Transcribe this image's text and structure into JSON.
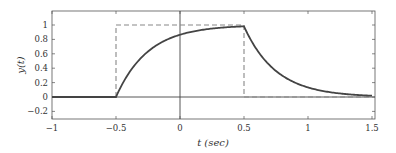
{
  "chart_data": {
    "type": "line",
    "title": "",
    "xlabel": "t (sec)",
    "ylabel": "y(t)",
    "xlim": [
      -1,
      1.5
    ],
    "ylim": [
      -0.3,
      1.2
    ],
    "xticks": [
      -1,
      -0.5,
      0,
      0.5,
      1,
      1.5
    ],
    "xtick_labels": [
      "−1",
      "−0.5",
      "0",
      "0.5",
      "1",
      "1.5"
    ],
    "yticks": [
      -0.2,
      0,
      0.2,
      0.4,
      0.6,
      0.8,
      1
    ],
    "ytick_labels": [
      "−0.2",
      "0",
      "0.2",
      "0.4",
      "0.6",
      "0.8",
      "1"
    ],
    "grid": false,
    "legend": null,
    "series": [
      {
        "name": "input pulse (dashed)",
        "style": "dashed",
        "color": "#888888",
        "x": [
          -1,
          -0.5,
          -0.5,
          0.5,
          0.5,
          1.5
        ],
        "y": [
          0,
          0,
          1,
          1,
          0,
          0
        ]
      },
      {
        "name": "response y(t)",
        "style": "solid",
        "color": "#444444",
        "time_constant": 0.25,
        "x": [
          -1,
          -0.5,
          -0.4,
          -0.3,
          -0.2,
          -0.1,
          0,
          0.1,
          0.2,
          0.3,
          0.4,
          0.5,
          0.6,
          0.7,
          0.8,
          0.9,
          1.0,
          1.1,
          1.2,
          1.3,
          1.4,
          1.5
        ],
        "y": [
          0,
          0,
          0.33,
          0.55,
          0.7,
          0.8,
          0.86,
          0.91,
          0.94,
          0.96,
          0.97,
          0.98,
          0.66,
          0.44,
          0.3,
          0.2,
          0.13,
          0.09,
          0.06,
          0.04,
          0.03,
          0.02
        ]
      }
    ]
  }
}
